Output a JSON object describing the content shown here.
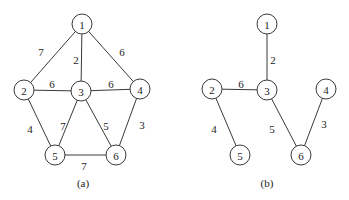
{
  "graphs": [
    {
      "id": "a",
      "caption": "(a)",
      "caption_pos": [
        83,
        183
      ],
      "nodes": [
        {
          "id": "1",
          "label": "1",
          "x": 82,
          "y": 24
        },
        {
          "id": "2",
          "label": "2",
          "x": 24,
          "y": 90
        },
        {
          "id": "3",
          "label": "3",
          "x": 81,
          "y": 91
        },
        {
          "id": "4",
          "label": "4",
          "x": 140,
          "y": 89
        },
        {
          "id": "5",
          "label": "5",
          "x": 55,
          "y": 155
        },
        {
          "id": "6",
          "label": "6",
          "x": 116,
          "y": 155
        }
      ],
      "edges": [
        {
          "from": "1",
          "to": "2",
          "weight": "7",
          "lx": 41,
          "ly": 52
        },
        {
          "from": "1",
          "to": "3",
          "weight": "2",
          "lx": 76,
          "ly": 60
        },
        {
          "from": "1",
          "to": "4",
          "weight": "6",
          "lx": 122,
          "ly": 52
        },
        {
          "from": "2",
          "to": "3",
          "weight": "6",
          "lx": 52,
          "ly": 84
        },
        {
          "from": "3",
          "to": "4",
          "weight": "6",
          "lx": 111,
          "ly": 84
        },
        {
          "from": "2",
          "to": "5",
          "weight": "4",
          "lx": 30,
          "ly": 129
        },
        {
          "from": "3",
          "to": "5",
          "weight": "7",
          "lx": 63,
          "ly": 126
        },
        {
          "from": "3",
          "to": "6",
          "weight": "5",
          "lx": 106,
          "ly": 126
        },
        {
          "from": "4",
          "to": "6",
          "weight": "3",
          "lx": 142,
          "ly": 125
        },
        {
          "from": "5",
          "to": "6",
          "weight": "7",
          "lx": 84,
          "ly": 166
        }
      ]
    },
    {
      "id": "b",
      "caption": "(b)",
      "caption_pos": [
        267,
        183
      ],
      "nodes": [
        {
          "id": "1",
          "label": "1",
          "x": 267,
          "y": 24
        },
        {
          "id": "2",
          "label": "2",
          "x": 212,
          "y": 89
        },
        {
          "id": "3",
          "label": "3",
          "x": 267,
          "y": 90
        },
        {
          "id": "4",
          "label": "4",
          "x": 326,
          "y": 89
        },
        {
          "id": "5",
          "label": "5",
          "x": 240,
          "y": 155
        },
        {
          "id": "6",
          "label": "6",
          "x": 301,
          "y": 155
        }
      ],
      "edges": [
        {
          "from": "1",
          "to": "3",
          "weight": "2",
          "lx": 273,
          "ly": 60
        },
        {
          "from": "2",
          "to": "3",
          "weight": "6",
          "lx": 241,
          "ly": 84
        },
        {
          "from": "2",
          "to": "5",
          "weight": "4",
          "lx": 214,
          "ly": 129
        },
        {
          "from": "3",
          "to": "6",
          "weight": "5",
          "lx": 272,
          "ly": 129
        },
        {
          "from": "4",
          "to": "6",
          "weight": "3",
          "lx": 324,
          "ly": 124
        }
      ]
    }
  ],
  "node_radius": 10
}
